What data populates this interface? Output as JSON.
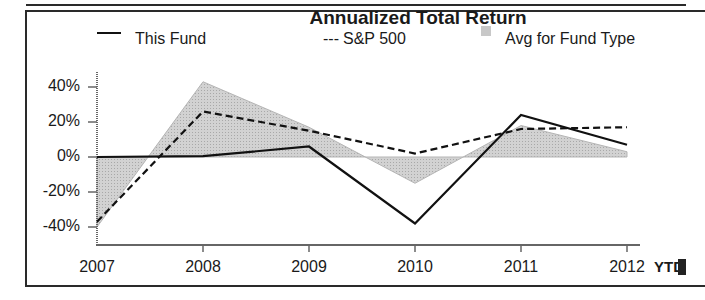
{
  "chart_data": {
    "type": "line",
    "title": "Annualized Total Return",
    "xlabel": "",
    "ylabel": "",
    "categories": [
      "2007",
      "2008",
      "2009",
      "2010",
      "2011",
      "2012"
    ],
    "x_extra_label": "YTD",
    "y_ticks": [
      "40%",
      "20%",
      "0%",
      "-20%",
      "-40%"
    ],
    "ylim": [
      -50,
      50
    ],
    "grid": false,
    "legend_position": "top",
    "series": [
      {
        "name": "This Fund",
        "style": "solid",
        "values": [
          0,
          0.5,
          6,
          -38,
          24,
          7
        ]
      },
      {
        "name": "S&P 500",
        "style": "dashed",
        "values": [
          -37,
          26,
          15,
          2,
          16,
          17
        ]
      },
      {
        "name": "Avg for Fund Type",
        "style": "area",
        "values": [
          -40,
          43,
          17,
          -15,
          18,
          3
        ]
      }
    ]
  },
  "legend": {
    "this_fund": "This Fund",
    "sp500_marker": "---",
    "sp500": "S&P 500",
    "avg": "Avg for Fund Type"
  },
  "colors": {
    "line": "#111111",
    "area_fill": "#c8c8c8",
    "axis": "#555555"
  }
}
